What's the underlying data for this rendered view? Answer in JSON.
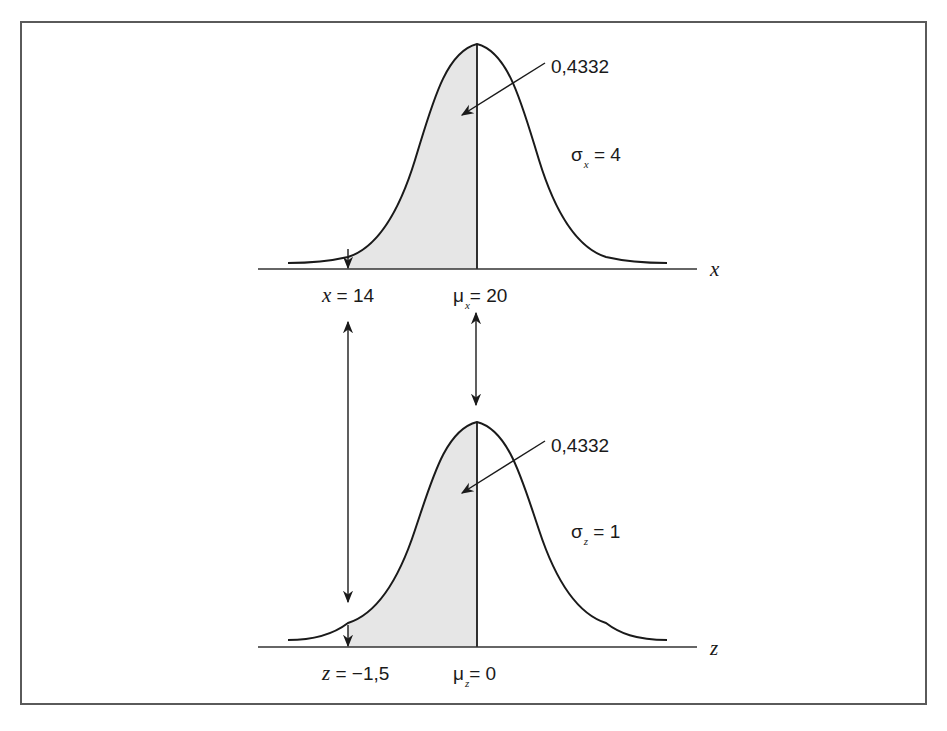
{
  "figure": {
    "top_panel": {
      "axis_label": "x",
      "area_label": "0,4332",
      "sigma_symbol": "σ",
      "sigma_sub": "x",
      "sigma_rest": " = 4",
      "left_marker_var": "x",
      "left_marker_rest": " = 14",
      "mean_symbol": "μ",
      "mean_sub": "x",
      "mean_rest": "= 20"
    },
    "bottom_panel": {
      "axis_label": "z",
      "area_label": "0,4332",
      "sigma_symbol": "σ",
      "sigma_sub": "z",
      "sigma_rest": " = 1",
      "left_marker_var": "z",
      "left_marker_rest": " = −1,5",
      "mean_symbol": "μ",
      "mean_sub": "z",
      "mean_rest": "= 0"
    },
    "colors": {
      "line": "#1a1a1a",
      "shade": "#e6e6e6",
      "frame": "#5a5a5a"
    }
  }
}
